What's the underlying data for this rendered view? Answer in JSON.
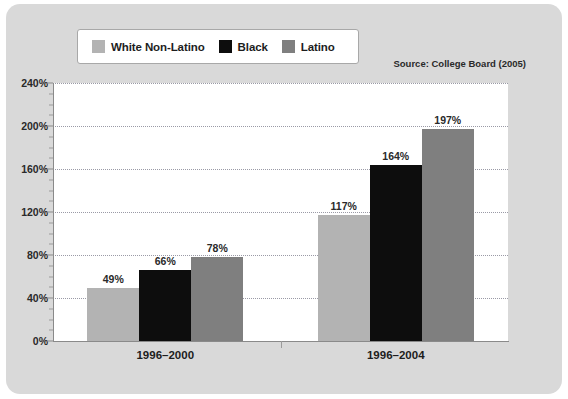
{
  "source_note": "Source: College Board (2005)",
  "legend": {
    "items": [
      {
        "label": "White Non-Latino",
        "color": "#b3b3b3",
        "name": "white-non-latino"
      },
      {
        "label": "Black",
        "color": "#0d0d0d",
        "name": "black"
      },
      {
        "label": "Latino",
        "color": "#7f7f7f",
        "name": "latino"
      }
    ]
  },
  "chart_data": {
    "type": "bar",
    "title": "",
    "subtitle": "",
    "xlabel": "",
    "ylabel": "",
    "categories": [
      "1996–2000",
      "1996–2004"
    ],
    "series": [
      {
        "name": "White Non-Latino",
        "color": "#b3b3b3",
        "values": [
          49,
          117
        ],
        "labels": [
          "49%",
          "117%"
        ]
      },
      {
        "name": "Black",
        "color": "#0d0d0d",
        "values": [
          66,
          164
        ],
        "labels": [
          "66%",
          "164%"
        ]
      },
      {
        "name": "Latino",
        "color": "#7f7f7f",
        "values": [
          78,
          197
        ],
        "labels": [
          "78%",
          "197%"
        ]
      }
    ],
    "ylim": [
      0,
      240
    ],
    "ytick_step": 40,
    "yticks": [
      0,
      40,
      80,
      120,
      160,
      200,
      240
    ],
    "ytick_labels": [
      "0%",
      "40%",
      "80%",
      "120%",
      "160%",
      "200%",
      "240%"
    ],
    "y_minor_step": 10,
    "grid": true,
    "grid_style": "dotted",
    "legend_position": "top-left",
    "annotations": [
      "Source: College Board (2005)"
    ],
    "value_label_suffix": "%"
  }
}
